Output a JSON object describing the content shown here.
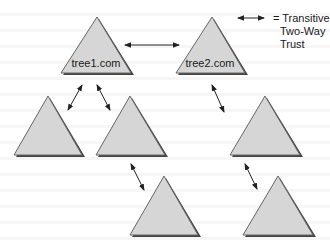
{
  "diagram": {
    "type": "forest-trust-diagram",
    "colors": {
      "triangle_fill": "#d6d6d6",
      "triangle_stroke": "#555555",
      "shadow": "#444444",
      "arrow": "#222222"
    },
    "legend": {
      "line1": "= Transitive",
      "line2": "Two-Way",
      "line3": "Trust",
      "symbol": "double-headed-arrow"
    },
    "nodes": [
      {
        "id": "t1",
        "label": "tree1.com"
      },
      {
        "id": "t2",
        "label": "tree2.com"
      },
      {
        "id": "t3",
        "label": ""
      },
      {
        "id": "t4",
        "label": ""
      },
      {
        "id": "t5",
        "label": ""
      },
      {
        "id": "t6",
        "label": ""
      },
      {
        "id": "t7",
        "label": ""
      }
    ],
    "edges": [
      {
        "from": "t1",
        "to": "t2",
        "type": "two-way-transitive"
      },
      {
        "from": "t1",
        "to": "t3",
        "type": "two-way-transitive"
      },
      {
        "from": "t1",
        "to": "t4",
        "type": "two-way-transitive"
      },
      {
        "from": "t2",
        "to": "t5",
        "type": "two-way-transitive"
      },
      {
        "from": "t4",
        "to": "t6",
        "type": "two-way-transitive"
      },
      {
        "from": "t5",
        "to": "t7",
        "type": "two-way-transitive"
      }
    ]
  }
}
